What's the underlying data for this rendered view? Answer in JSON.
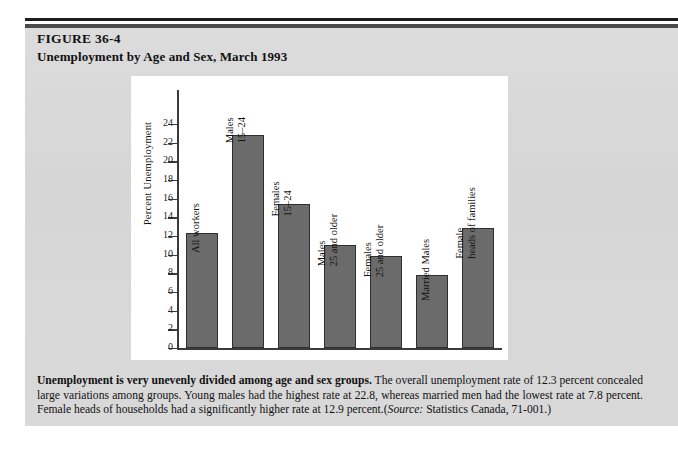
{
  "figure": {
    "number": "FIGURE 36-4",
    "title": "Unemployment by Age and Sex, March 1993"
  },
  "caption": {
    "lead": "Unemployment is very unevenly divided among age and sex groups.",
    "body": " The overall unemployment rate of 12.3 percent concealed large variations among groups. Young males had the highest rate at 22.8, whereas married men had the lowest rate at 7.8 percent. Female heads of households had a significantly higher rate at 12.9 percent.(",
    "source_label": "Source:",
    "source_text": " Statistics Canada, 71-001.)"
  },
  "chart_data": {
    "type": "bar",
    "title": "Unemployment by Age and Sex, March 1993",
    "xlabel": "",
    "ylabel": "Percent Unemployment",
    "ylim": [
      0,
      25
    ],
    "yticks": [
      0,
      2,
      4,
      6,
      8,
      10,
      12,
      14,
      16,
      18,
      20,
      22,
      24
    ],
    "grid": false,
    "legend": "none",
    "bar_color": "#6b6b6b",
    "bar_edge_color": "#2f2f2f",
    "categories": [
      "All workers",
      "Males 15-24",
      "Females 15-24",
      "Males 25 and older",
      "Females 25 and older",
      "Married Males",
      "Female heads of families"
    ],
    "category_lines": [
      [
        "All workers",
        ""
      ],
      [
        "Males",
        "15–24"
      ],
      [
        "Females",
        "15–24"
      ],
      [
        "Males",
        "25 and older"
      ],
      [
        "Females",
        "25 and older"
      ],
      [
        "Married Males",
        ""
      ],
      [
        "Female",
        "heads of families"
      ]
    ],
    "values": [
      12.3,
      22.8,
      15.4,
      11.0,
      9.9,
      7.8,
      12.9
    ]
  }
}
